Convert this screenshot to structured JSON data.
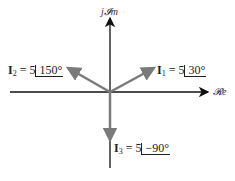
{
  "diagram": {
    "type": "phasor-diagram",
    "axes": {
      "imag_label": "j𝓘m",
      "real_label": "𝓡e"
    },
    "phasors": [
      {
        "name": "I",
        "sub": "1",
        "magnitude": "5",
        "angle": "30°",
        "label_prefix": "= 5"
      },
      {
        "name": "I",
        "sub": "2",
        "magnitude": "5",
        "angle": "150°",
        "label_prefix": "= 5"
      },
      {
        "name": "I",
        "sub": "3",
        "magnitude": "5",
        "angle": "−90°",
        "label_prefix": "= 5"
      }
    ],
    "colors": {
      "axis": "#111111",
      "phasor": "#7a7a7a"
    }
  }
}
